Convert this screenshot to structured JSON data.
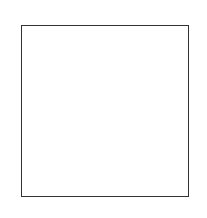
{
  "board": {
    "files": [
      "a",
      "b",
      "c",
      "d",
      "e",
      "f",
      "g",
      "h"
    ],
    "ranks": [
      "8",
      "7",
      "6",
      "5",
      "4",
      "3",
      "2",
      "1"
    ],
    "light_square_color": "#ffffff",
    "dark_square_hatch_color": "#9a9a9a",
    "pieces": [
      {
        "square": "d7",
        "color": "white",
        "type": "pawn",
        "glyph": "♙"
      },
      {
        "square": "e7",
        "color": "white",
        "type": "king",
        "glyph": "♔"
      },
      {
        "square": "f7",
        "color": "black",
        "type": "knight",
        "glyph": "♞"
      },
      {
        "square": "g7",
        "color": "black",
        "type": "king",
        "glyph": "♚"
      },
      {
        "square": "h1",
        "color": "white",
        "type": "knight",
        "glyph": "♘"
      }
    ]
  }
}
